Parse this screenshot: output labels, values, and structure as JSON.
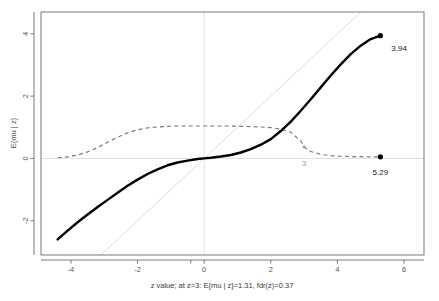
{
  "chart_data": {
    "type": "line",
    "title": "",
    "xlabel": "z value; at z=3: E{mu | z}=1.31, fdr(z)=0.37",
    "ylabel": "E{mu | z}",
    "xlim": [
      -4.9,
      6.6
    ],
    "ylim": [
      -3.1,
      4.7
    ],
    "xticks": [
      -4,
      -2,
      0,
      2,
      4,
      6
    ],
    "xticklabels": [
      "-4",
      "-2",
      "0",
      "2",
      "4",
      "6"
    ],
    "yticks": [
      -2,
      0,
      2,
      4
    ],
    "yticklabels": [
      "-2",
      "0",
      "2",
      "4"
    ],
    "grid": false,
    "legend": "none",
    "series": [
      {
        "name": "E{mu | z}",
        "style": "solid",
        "color": "#000000",
        "x": [
          -4.4,
          -4.1,
          -3.8,
          -3.5,
          -3.2,
          -2.9,
          -2.6,
          -2.3,
          -2.0,
          -1.7,
          -1.4,
          -1.1,
          -0.8,
          -0.5,
          -0.2,
          0.0,
          0.2,
          0.5,
          0.8,
          1.1,
          1.4,
          1.7,
          2.0,
          2.3,
          2.6,
          2.9,
          3.2,
          3.5,
          3.8,
          4.1,
          4.4,
          4.7,
          5.0,
          5.29
        ],
        "y": [
          -2.6,
          -2.32,
          -2.05,
          -1.8,
          -1.56,
          -1.33,
          -1.1,
          -0.88,
          -0.68,
          -0.5,
          -0.35,
          -0.22,
          -0.13,
          -0.07,
          -0.02,
          0.0,
          0.02,
          0.06,
          0.11,
          0.19,
          0.3,
          0.44,
          0.62,
          0.88,
          1.18,
          1.53,
          1.9,
          2.28,
          2.66,
          3.02,
          3.35,
          3.62,
          3.83,
          3.94
        ]
      },
      {
        "name": "fdr(z)",
        "style": "dashed",
        "color": "#7a7a7a",
        "x": [
          -4.4,
          -4.1,
          -3.8,
          -3.5,
          -3.2,
          -2.9,
          -2.6,
          -2.3,
          -2.0,
          -1.7,
          -1.4,
          -1.1,
          -0.8,
          -0.5,
          -0.2,
          0.0,
          0.2,
          0.5,
          0.8,
          1.1,
          1.4,
          1.7,
          2.0,
          2.3,
          2.6,
          2.9,
          3.0,
          3.2,
          3.5,
          3.8,
          4.1,
          4.4,
          4.7,
          5.0,
          5.29
        ],
        "y": [
          0.02,
          0.05,
          0.11,
          0.21,
          0.35,
          0.52,
          0.68,
          0.82,
          0.92,
          0.98,
          1.01,
          1.03,
          1.04,
          1.04,
          1.04,
          1.04,
          1.04,
          1.04,
          1.04,
          1.03,
          1.02,
          1.01,
          0.99,
          0.94,
          0.84,
          0.56,
          0.37,
          0.22,
          0.13,
          0.09,
          0.07,
          0.06,
          0.06,
          0.05,
          0.05
        ]
      },
      {
        "name": "identity",
        "style": "solid-light",
        "color": "#dcdcdc",
        "x": [
          -3.1,
          4.7
        ],
        "y": [
          -3.1,
          4.7
        ]
      }
    ],
    "reference_lines": [
      {
        "name": "zero-horizontal",
        "orientation": "horizontal",
        "value": 0,
        "color": "#e0e0e0"
      },
      {
        "name": "zero-vertical",
        "orientation": "vertical",
        "value": 0,
        "color": "#e0e0e0"
      }
    ],
    "points": [
      {
        "name": "emu-endpoint",
        "x": 5.29,
        "y": 3.94,
        "label": "3.94",
        "label_color": "#1a1a1a",
        "marker": "filled-circle",
        "color": "#000000"
      },
      {
        "name": "fdr-endpoint",
        "x": 5.29,
        "y": 0.05,
        "label": "5.29",
        "label_color": "#1a1a1a",
        "marker": "filled-circle",
        "color": "#000000"
      },
      {
        "name": "fdr-at-z3",
        "x": 3.0,
        "y": 0.37,
        "label": "3",
        "label_color": "#9a9a9a",
        "marker": "small-circle",
        "color": "#9a9a9a"
      }
    ],
    "annotations": {
      "z_query": "3",
      "emu_at_z": "1.31",
      "fdr_at_z": "0.37",
      "max_emu_label": "3.94",
      "max_z_label": "5.29"
    }
  }
}
